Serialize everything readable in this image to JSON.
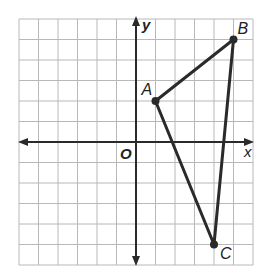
{
  "diagram": {
    "type": "coordinate-grid",
    "grid": {
      "x_min": -6,
      "x_max": 6,
      "y_min": -6,
      "y_max": 6,
      "origin_px": [
        136,
        142
      ],
      "unit_x_px": 19.5,
      "unit_y_px": 20.5,
      "grid_color": "#b8b8b8",
      "axis_color": "#2a2a2a"
    },
    "axes": {
      "x_label": "x",
      "y_label": "y",
      "origin_label": "O"
    },
    "points": [
      {
        "name": "A",
        "x": 1,
        "y": 2,
        "label_dx": -14,
        "label_dy": -6
      },
      {
        "name": "B",
        "x": 5,
        "y": 5,
        "label_dx": 4,
        "label_dy": -6
      },
      {
        "name": "C",
        "x": 4,
        "y": -5,
        "label_dx": 6,
        "label_dy": 14
      }
    ],
    "segments": [
      [
        "A",
        "B"
      ],
      [
        "B",
        "C"
      ],
      [
        "C",
        "A"
      ]
    ],
    "line_color": "#2a2a2a"
  }
}
